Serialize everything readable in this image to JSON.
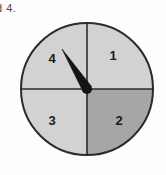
{
  "page": {
    "background_color": "#fdfdfd",
    "width": 166,
    "height": 175
  },
  "caption": {
    "text_fragment": "d 4."
  },
  "spinner": {
    "name": "four-sector-spinner",
    "center": {
      "x": 87,
      "y": 89
    },
    "radius": 66,
    "outline_color": "#2b2b2b",
    "divider_color": "#2b2b2b",
    "needle": {
      "color": "#141414",
      "tip": {
        "x": 62,
        "y": 49
      },
      "pointing_at_sector": "4",
      "angle_degrees": 328
    },
    "hub": {
      "color": "#141414",
      "radius": 5
    },
    "sectors": [
      {
        "label": "1",
        "position": "top-right",
        "fill": "#d2d2d2",
        "label_x": 113,
        "label_y": 57
      },
      {
        "label": "2",
        "position": "bottom-right",
        "fill": "#a6a6a6",
        "label_x": 119,
        "label_y": 122
      },
      {
        "label": "3",
        "position": "bottom-left",
        "fill": "#d2d2d2",
        "label_x": 52,
        "label_y": 122
      },
      {
        "label": "4",
        "position": "top-left",
        "fill": "#d2d2d2",
        "label_x": 52,
        "label_y": 60
      }
    ]
  }
}
